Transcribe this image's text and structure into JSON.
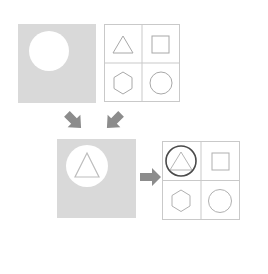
{
  "diagram": {
    "colors": {
      "panel_gray": "#d9d9d9",
      "panel_gray_dark": "#d2d2d2",
      "grid_line": "#c9c9c9",
      "shape_stroke": "#a8a8a8",
      "highlight_stroke": "#4a4a4a",
      "arrow_fill": "#8c8c8c",
      "white": "#ffffff",
      "background": "#ffffff"
    },
    "nodes": [
      {
        "id": "source-plate-top",
        "name": "gray-plate-with-circle-hole",
        "kind": "gray-panel",
        "x": 18,
        "y": 24,
        "w": 78,
        "h": 79,
        "contents": [
          {
            "shape": "circle-hole",
            "cx": 31,
            "cy": 27,
            "r": 20,
            "fill": "#ffffff"
          }
        ]
      },
      {
        "id": "shape-grid-top",
        "name": "shape-grid-initial",
        "kind": "grid-panel",
        "x": 104,
        "y": 24,
        "w": 76,
        "h": 78,
        "rows": 2,
        "cols": 2,
        "cells": [
          {
            "row": 0,
            "col": 0,
            "shape": "triangle",
            "highlighted": false
          },
          {
            "row": 0,
            "col": 1,
            "shape": "square",
            "highlighted": false
          },
          {
            "row": 1,
            "col": 0,
            "shape": "hexagon",
            "highlighted": false
          },
          {
            "row": 1,
            "col": 1,
            "shape": "circle",
            "highlighted": false
          }
        ]
      },
      {
        "id": "result-plate-middle",
        "name": "gray-plate-with-circle-and-triangle",
        "kind": "gray-panel",
        "x": 57,
        "y": 139,
        "w": 79,
        "h": 79,
        "contents": [
          {
            "shape": "circle-hole",
            "cx": 30,
            "cy": 27,
            "r": 21,
            "fill": "#ffffff"
          },
          {
            "shape": "triangle-outline",
            "cx": 30,
            "cy": 30,
            "size": 26,
            "stroke": "#bdbdbd"
          }
        ]
      },
      {
        "id": "shape-grid-result",
        "name": "shape-grid-result",
        "kind": "grid-panel",
        "x": 162,
        "y": 141,
        "w": 78,
        "h": 79,
        "rows": 2,
        "cols": 2,
        "cells": [
          {
            "row": 0,
            "col": 0,
            "shape": "circle-over-triangle",
            "highlighted": true
          },
          {
            "row": 0,
            "col": 1,
            "shape": "square",
            "highlighted": false
          },
          {
            "row": 1,
            "col": 0,
            "shape": "hexagon",
            "highlighted": false
          },
          {
            "row": 1,
            "col": 1,
            "shape": "circle",
            "highlighted": false
          }
        ]
      }
    ],
    "arrows": [
      {
        "id": "arrow-down-right",
        "name": "arrow-from-plate-to-result",
        "x": 63,
        "y": 110,
        "w": 22,
        "h": 22,
        "direction": "down-right",
        "rotation": 45
      },
      {
        "id": "arrow-down-left",
        "name": "arrow-from-grid-to-result",
        "x": 103,
        "y": 110,
        "w": 22,
        "h": 22,
        "direction": "down-left",
        "rotation": 135
      },
      {
        "id": "arrow-right",
        "name": "arrow-from-result-to-grid",
        "x": 140,
        "y": 167,
        "w": 22,
        "h": 20,
        "direction": "right",
        "rotation": 0
      }
    ]
  }
}
